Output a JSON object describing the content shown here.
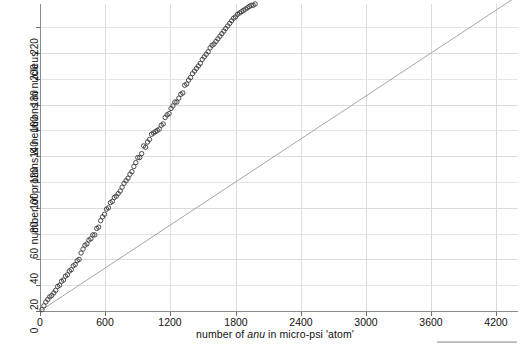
{
  "figure": {
    "xlabel_prefix": "number of ",
    "xlabel_italic": "anu",
    "xlabel_suffix": " in micro-psi 'atom'",
    "ylabel": "number of protons & neutrons in nucleus"
  },
  "chart_data": {
    "type": "scatter",
    "title": "",
    "xlabel": "number of anu in micro-psi 'atom'",
    "ylabel": "number of protons & neutrons in nucleus",
    "xlim": [
      0,
      4400
    ],
    "ylim": [
      0,
      238
    ],
    "xticks": [
      0,
      600,
      1200,
      1800,
      2400,
      3000,
      3600,
      4200
    ],
    "yticks": [
      0,
      20,
      40,
      60,
      80,
      100,
      120,
      140,
      160,
      180,
      200,
      220
    ],
    "xtick_labels": [
      "0",
      "600",
      "1200",
      "1800",
      "2400",
      "3000",
      "3600",
      "4200"
    ],
    "ytick_labels": [
      "0",
      "20",
      "40",
      "60",
      "80",
      "100",
      "120",
      "140",
      "160",
      "180",
      "200",
      "220"
    ],
    "grid": true,
    "legend": false,
    "marker": "open-circle",
    "marker_color": "#3a3a3a",
    "marker_size": 4.4,
    "trendline": {
      "visible": true,
      "color": "#8f8f8f",
      "slope": 0.05556,
      "intercept": 0.0,
      "x_start": 0,
      "x_end": 4380
    },
    "x": [
      18,
      36,
      54,
      72,
      90,
      108,
      127,
      144,
      162,
      180,
      198,
      216,
      234,
      252,
      270,
      288,
      306,
      324,
      342,
      360,
      378,
      396,
      414,
      432,
      450,
      468,
      486,
      504,
      522,
      540,
      558,
      576,
      594,
      612,
      630,
      648,
      666,
      684,
      702,
      720,
      738,
      756,
      774,
      792,
      810,
      828,
      846,
      864,
      882,
      900,
      918,
      936,
      954,
      972,
      990,
      1008,
      1026,
      1044,
      1062,
      1080,
      1098,
      1116,
      1134,
      1152,
      1170,
      1188,
      1206,
      1224,
      1242,
      1260,
      1278,
      1296,
      1314,
      1332,
      1350,
      1368,
      1386,
      1404,
      1422,
      1440,
      1458,
      1476,
      1494,
      1512,
      1530,
      1548,
      1566,
      1584,
      1602,
      1620,
      1638,
      1656,
      1674,
      1692,
      1710,
      1728,
      1746,
      1764,
      1782,
      1800,
      1818,
      1836,
      1854,
      1872,
      1890,
      1908,
      1926,
      1944,
      1962,
      1980
    ],
    "y": [
      1,
      4,
      7,
      9,
      11,
      12,
      14,
      16,
      19,
      20,
      23,
      24,
      27,
      28,
      31,
      32,
      35,
      36,
      39,
      40,
      45,
      48,
      51,
      52,
      55,
      56,
      59,
      59,
      64,
      65,
      70,
      73,
      75,
      79,
      80,
      84,
      85,
      88,
      89,
      91,
      93,
      96,
      99,
      101,
      103,
      106,
      108,
      112,
      115,
      119,
      119,
      122,
      128,
      127,
      131,
      133,
      137,
      138,
      139,
      140,
      141,
      144,
      145,
      150,
      152,
      153,
      157,
      159,
      162,
      162,
      165,
      168,
      169,
      175,
      176,
      179,
      181,
      184,
      186,
      188,
      190,
      192,
      195,
      197,
      199,
      201,
      204,
      206,
      207,
      209,
      211,
      213,
      215,
      217,
      219,
      221,
      223,
      225,
      227,
      228,
      230,
      231,
      232,
      233,
      234,
      235,
      236,
      237,
      237,
      238
    ],
    "n_points": 110
  }
}
